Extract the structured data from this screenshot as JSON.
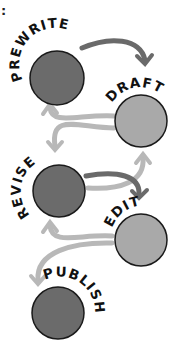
{
  "corner_mark": ":",
  "colors": {
    "dark_circle": "#6b6b6b",
    "light_circle": "#a9a9a9",
    "outline": "#1a1a1a",
    "dark_arrow": "#6a6a6a",
    "light_arrow": "#b8b8b8",
    "label": "#111111"
  },
  "stages": [
    {
      "id": "prewrite",
      "label": "PREWRITE",
      "shade": "dark"
    },
    {
      "id": "draft",
      "label": "DRAFT",
      "shade": "light"
    },
    {
      "id": "revise",
      "label": "REVISE",
      "shade": "dark"
    },
    {
      "id": "edit",
      "label": "EDIT",
      "shade": "light"
    },
    {
      "id": "publish",
      "label": "PUBLISH",
      "shade": "dark"
    }
  ],
  "arrows": [
    {
      "from": "prewrite",
      "to": "draft",
      "shade": "dark"
    },
    {
      "from": "draft",
      "to": "prewrite",
      "shade": "light"
    },
    {
      "from": "draft",
      "to": "revise",
      "shade": "light"
    },
    {
      "from": "revise",
      "to": "draft",
      "shade": "light"
    },
    {
      "from": "revise",
      "to": "edit",
      "shade": "dark"
    },
    {
      "from": "edit",
      "to": "revise",
      "shade": "light"
    },
    {
      "from": "edit",
      "to": "publish",
      "shade": "light"
    }
  ]
}
